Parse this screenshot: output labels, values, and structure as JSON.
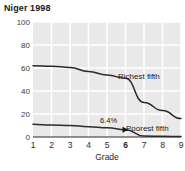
{
  "chart_data": {
    "type": "line",
    "title": "Niger 1998",
    "xlabel": "Grade",
    "ylabel": "",
    "x": [
      1,
      2,
      3,
      4,
      5,
      6,
      7,
      8,
      9
    ],
    "xtick_labels": [
      "1",
      "2",
      "3",
      "4",
      "5",
      "6",
      "7",
      "8",
      "9"
    ],
    "xtick_emphasis": "6",
    "ytick_labels": [
      "0",
      "20",
      "40",
      "60",
      "80",
      "100"
    ],
    "ytick_values": [
      0,
      20,
      40,
      60,
      80,
      100
    ],
    "ylim": [
      0,
      100
    ],
    "xlim": [
      1,
      9
    ],
    "grid": true,
    "grid_color": "#ffffff",
    "plot_background": "#e9e9e9",
    "legend_position": "inline-annotations",
    "series": [
      {
        "name": "Richest fifth",
        "label": "Richest fifth",
        "color": "#2b2b2b",
        "values": [
          62,
          61.5,
          60.5,
          57,
          54,
          51,
          30,
          23,
          16
        ]
      },
      {
        "name": "Poorest fifth",
        "label": "Poorest fifth",
        "color": "#2b2b2b",
        "values": [
          11,
          10.5,
          10,
          9,
          8,
          6.4,
          0.8,
          0.6,
          0.4
        ]
      }
    ],
    "annotations": [
      {
        "text": "6.4%",
        "series": "Poorest fifth",
        "x": 6,
        "y": 6.4,
        "marker": "triangle"
      }
    ]
  },
  "chart": {
    "title": "Niger 1998",
    "xlabel": "Grade",
    "value_annotation": "6.4%",
    "richest_label": "Richest fifth",
    "poorest_label": "Poorest fifth"
  }
}
